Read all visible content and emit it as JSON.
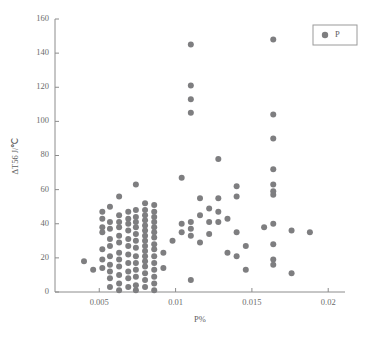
{
  "chart_data": {
    "type": "scatter",
    "title": "",
    "xlabel": "P%",
    "ylabel": "ΔT56 J/℃",
    "xlim": [
      0.0021,
      0.0211
    ],
    "ylim": [
      0,
      160
    ],
    "grid": false,
    "legend_position": "top-right",
    "marker_color": "#7e7e80",
    "axis_color": "#8c8c8c",
    "text_color": "#5f5f5f",
    "xticks": [
      0.005,
      0.01,
      0.015,
      0.02
    ],
    "xtick_labels": [
      "0.005",
      "0.01",
      "0.015",
      "0.02"
    ],
    "yticks": [
      0,
      20,
      40,
      60,
      80,
      100,
      120,
      140,
      160
    ],
    "ytick_labels": [
      "0",
      "20",
      "40",
      "60",
      "80",
      "100",
      "120",
      "140",
      "160"
    ],
    "series": [
      {
        "name": "P",
        "marker": "circle",
        "color": "#7e7e80",
        "points": [
          [
            0.004,
            18
          ],
          [
            0.0046,
            13
          ],
          [
            0.0052,
            47
          ],
          [
            0.0052,
            43
          ],
          [
            0.0052,
            38
          ],
          [
            0.0052,
            35
          ],
          [
            0.0052,
            25
          ],
          [
            0.0052,
            19
          ],
          [
            0.0052,
            14
          ],
          [
            0.0057,
            50
          ],
          [
            0.0057,
            41
          ],
          [
            0.0057,
            37
          ],
          [
            0.0057,
            31
          ],
          [
            0.0057,
            27
          ],
          [
            0.0057,
            21
          ],
          [
            0.0057,
            16
          ],
          [
            0.0057,
            12
          ],
          [
            0.0057,
            8
          ],
          [
            0.0057,
            3
          ],
          [
            0.0063,
            56
          ],
          [
            0.0063,
            45
          ],
          [
            0.0063,
            41
          ],
          [
            0.0063,
            38
          ],
          [
            0.0063,
            33
          ],
          [
            0.0063,
            29
          ],
          [
            0.0063,
            23
          ],
          [
            0.0063,
            19
          ],
          [
            0.0063,
            15
          ],
          [
            0.0063,
            10
          ],
          [
            0.0063,
            5
          ],
          [
            0.0063,
            1
          ],
          [
            0.0069,
            47
          ],
          [
            0.0069,
            43
          ],
          [
            0.0069,
            40
          ],
          [
            0.0069,
            36
          ],
          [
            0.0069,
            31
          ],
          [
            0.0069,
            27
          ],
          [
            0.0069,
            22
          ],
          [
            0.0069,
            17
          ],
          [
            0.0069,
            12
          ],
          [
            0.0069,
            8
          ],
          [
            0.0069,
            3
          ],
          [
            0.0074,
            63
          ],
          [
            0.0074,
            48
          ],
          [
            0.0074,
            44
          ],
          [
            0.0074,
            41
          ],
          [
            0.0074,
            38
          ],
          [
            0.0074,
            34
          ],
          [
            0.0074,
            30
          ],
          [
            0.0074,
            26
          ],
          [
            0.0074,
            21
          ],
          [
            0.0074,
            17
          ],
          [
            0.0074,
            13
          ],
          [
            0.0074,
            9
          ],
          [
            0.0074,
            4
          ],
          [
            0.0074,
            1
          ],
          [
            0.008,
            52
          ],
          [
            0.008,
            48
          ],
          [
            0.008,
            45
          ],
          [
            0.008,
            42
          ],
          [
            0.008,
            39
          ],
          [
            0.008,
            36
          ],
          [
            0.008,
            33
          ],
          [
            0.008,
            30
          ],
          [
            0.008,
            27
          ],
          [
            0.008,
            24
          ],
          [
            0.008,
            21
          ],
          [
            0.008,
            18
          ],
          [
            0.008,
            15
          ],
          [
            0.008,
            11
          ],
          [
            0.008,
            7
          ],
          [
            0.008,
            3
          ],
          [
            0.0086,
            51
          ],
          [
            0.0086,
            47
          ],
          [
            0.0086,
            44
          ],
          [
            0.0086,
            41
          ],
          [
            0.0086,
            38
          ],
          [
            0.0086,
            35
          ],
          [
            0.0086,
            32
          ],
          [
            0.0086,
            28
          ],
          [
            0.0086,
            25
          ],
          [
            0.0086,
            21
          ],
          [
            0.0086,
            17
          ],
          [
            0.0086,
            13
          ],
          [
            0.0086,
            9
          ],
          [
            0.0086,
            5
          ],
          [
            0.0086,
            1
          ],
          [
            0.0092,
            23
          ],
          [
            0.0092,
            14
          ],
          [
            0.0098,
            30
          ],
          [
            0.0104,
            67
          ],
          [
            0.0104,
            40
          ],
          [
            0.0104,
            35
          ],
          [
            0.011,
            145
          ],
          [
            0.011,
            121
          ],
          [
            0.011,
            113
          ],
          [
            0.011,
            105
          ],
          [
            0.011,
            41
          ],
          [
            0.011,
            37
          ],
          [
            0.011,
            33
          ],
          [
            0.011,
            7
          ],
          [
            0.0116,
            55
          ],
          [
            0.0116,
            45
          ],
          [
            0.0116,
            29
          ],
          [
            0.0122,
            49
          ],
          [
            0.0122,
            41
          ],
          [
            0.0122,
            34
          ],
          [
            0.0128,
            78
          ],
          [
            0.0128,
            55
          ],
          [
            0.0128,
            47
          ],
          [
            0.0128,
            41
          ],
          [
            0.0134,
            43
          ],
          [
            0.0134,
            23
          ],
          [
            0.014,
            62
          ],
          [
            0.014,
            56
          ],
          [
            0.014,
            35
          ],
          [
            0.014,
            21
          ],
          [
            0.0146,
            27
          ],
          [
            0.0146,
            13
          ],
          [
            0.0158,
            38
          ],
          [
            0.0164,
            148
          ],
          [
            0.0164,
            104
          ],
          [
            0.0164,
            90
          ],
          [
            0.0164,
            72
          ],
          [
            0.0164,
            63
          ],
          [
            0.0164,
            59
          ],
          [
            0.0164,
            57
          ],
          [
            0.0164,
            40
          ],
          [
            0.0164,
            28
          ],
          [
            0.0164,
            19
          ],
          [
            0.0164,
            16
          ],
          [
            0.0176,
            36
          ],
          [
            0.0176,
            11
          ],
          [
            0.0188,
            35
          ]
        ]
      }
    ],
    "legend": [
      {
        "label": "P",
        "color": "#7e7e80"
      }
    ]
  }
}
